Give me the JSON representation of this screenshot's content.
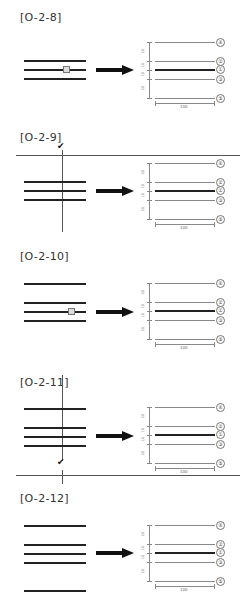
{
  "panels": [
    {
      "title": "[O-2-8]",
      "source_lines": 3,
      "marker_on_line": 2,
      "cut": null
    },
    {
      "title": "[O-2-9]",
      "source_lines": 3,
      "marker_on_line": null,
      "cut": "top-left-horizontal-and-vertical"
    },
    {
      "title": "[O-2-10]",
      "source_lines": 4,
      "marker_on_line": 3,
      "cut": null
    },
    {
      "title": "[O-2-11]",
      "source_lines": 4,
      "marker_on_line": null,
      "cut": "vertical-with-bottom-horizontal"
    },
    {
      "title": "[O-2-12]",
      "source_lines": 5,
      "marker_on_line": null,
      "cut": null
    }
  ],
  "result": {
    "labels": [
      "④",
      "②",
      "①",
      "③",
      "⑤"
    ],
    "dimensions_vertical": [
      "20",
      "10",
      "10",
      "20"
    ],
    "dimension_horizontal": "100"
  },
  "colors": {
    "line": "#222222",
    "thin_line": "#888888",
    "background": "#ffffff"
  }
}
